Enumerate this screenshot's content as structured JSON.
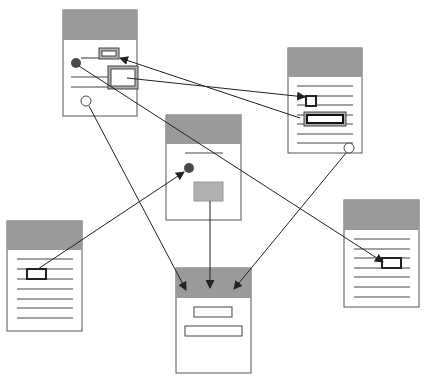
{
  "colors": {
    "header_fill": "#9a9a9a",
    "border": "#555555",
    "line": "#444444",
    "dot_fill": "#4a4a4a",
    "widget_fill": "#b0b0b0",
    "thick_stroke": "#222222",
    "arrow": "#222222"
  },
  "documents": [
    {
      "id": "doc-a",
      "x": 63,
      "y": 10,
      "w": 74,
      "h": 106,
      "header_h": 30
    },
    {
      "id": "doc-b",
      "x": 288,
      "y": 48,
      "w": 74,
      "h": 105,
      "header_h": 29
    },
    {
      "id": "doc-c",
      "x": 166,
      "y": 115,
      "w": 75,
      "h": 105,
      "header_h": 29
    },
    {
      "id": "doc-d",
      "x": 7,
      "y": 221,
      "w": 75,
      "h": 110,
      "header_h": 29
    },
    {
      "id": "doc-e",
      "x": 344,
      "y": 200,
      "w": 75,
      "h": 107,
      "header_h": 30
    },
    {
      "id": "doc-f",
      "x": 176,
      "y": 268,
      "w": 75,
      "h": 105,
      "header_h": 30
    }
  ],
  "icons": {
    "filled_dot": "filled-circle-icon",
    "open_dot": "open-circle-icon",
    "arrowhead": "arrowhead-icon"
  }
}
